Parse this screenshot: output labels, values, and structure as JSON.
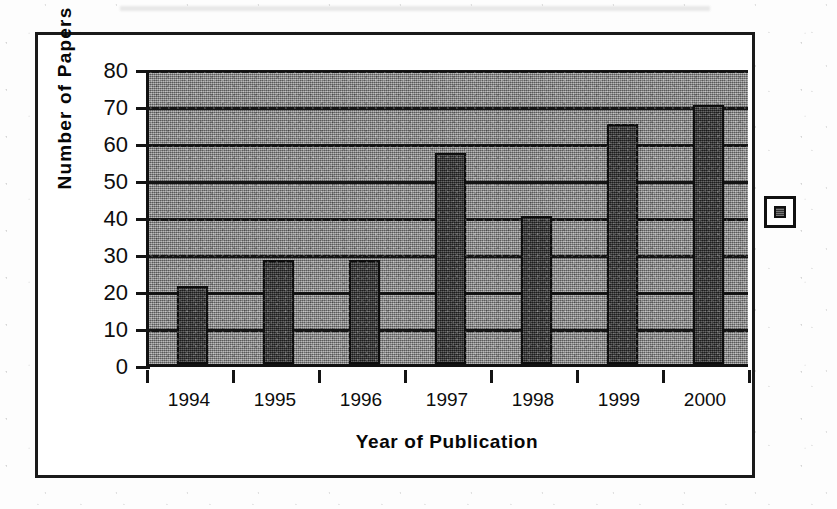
{
  "figure": {
    "frame": {
      "border_color": "#1a1a1a"
    },
    "legend_marker": {
      "name": "series-marker",
      "swatch_color": "#4a4a4a"
    }
  },
  "chart_data": {
    "type": "bar",
    "title": "",
    "xlabel": "Year of Publication",
    "ylabel": "Number of Papers",
    "categories": [
      "1994",
      "1995",
      "1996",
      "1997",
      "1998",
      "1999",
      "2000"
    ],
    "values": [
      21,
      28,
      28,
      57,
      40,
      65,
      70
    ],
    "ylim": [
      0,
      80
    ],
    "yticks": [
      0,
      10,
      20,
      30,
      40,
      50,
      60,
      70,
      80
    ],
    "ytick_labels": [
      "0",
      "10",
      "20",
      "30",
      "40",
      "50",
      "60",
      "70",
      "80"
    ],
    "grid": true,
    "grid_axis": "y",
    "legend_position": "right",
    "bar_color": "#3b3b3b",
    "plot_background_color": "#878787",
    "axis_color": "#141414"
  }
}
